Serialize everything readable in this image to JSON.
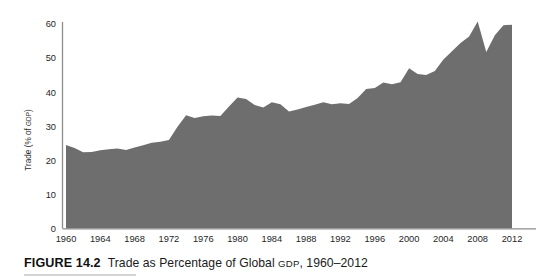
{
  "figure": {
    "label": "FIGURE 14.2",
    "title_before_gdp": "Trade as Percentage of Global ",
    "title_gdp": "GDP",
    "title_after_gdp": ", 1960–2012"
  },
  "axes": {
    "y_label_before_gdp": "Trade (% of ",
    "y_label_gdp": "GDP",
    "y_label_after_gdp": ")",
    "y_ticks": [
      "0",
      "10",
      "20",
      "30",
      "40",
      "50",
      "60"
    ],
    "x_ticks": [
      "1960",
      "1964",
      "1968",
      "1972",
      "1976",
      "1980",
      "1984",
      "1988",
      "1992",
      "1996",
      "2000",
      "2004",
      "2008",
      "2012"
    ]
  },
  "colors": {
    "area_fill": "#6e6e6e",
    "axis_line": "#8c8c8c",
    "text": "#1a1a1a",
    "background": "#ffffff"
  },
  "chart_data": {
    "type": "area",
    "title": "Trade as Percentage of Global GDP, 1960–2012",
    "xlabel": "",
    "ylabel": "Trade (% of GDP)",
    "ylim": [
      0,
      62
    ],
    "xlim": [
      1960,
      2012
    ],
    "grid": false,
    "legend": "none",
    "x": [
      1960,
      1961,
      1962,
      1963,
      1964,
      1965,
      1966,
      1967,
      1968,
      1969,
      1970,
      1971,
      1972,
      1973,
      1974,
      1975,
      1976,
      1977,
      1978,
      1979,
      1980,
      1981,
      1982,
      1983,
      1984,
      1985,
      1986,
      1987,
      1988,
      1989,
      1990,
      1991,
      1992,
      1993,
      1994,
      1995,
      1996,
      1997,
      1998,
      1999,
      2000,
      2001,
      2002,
      2003,
      2004,
      2005,
      2006,
      2007,
      2008,
      2009,
      2010,
      2011,
      2012
    ],
    "values": [
      24.5,
      23.6,
      22.3,
      22.4,
      22.9,
      23.2,
      23.4,
      23.0,
      23.7,
      24.4,
      25.1,
      25.4,
      25.9,
      29.8,
      33.2,
      32.4,
      32.9,
      33.1,
      33.0,
      35.8,
      38.4,
      38.0,
      36.2,
      35.5,
      37.0,
      36.4,
      34.3,
      34.9,
      35.6,
      36.3,
      37.0,
      36.4,
      36.7,
      36.5,
      38.3,
      40.9,
      41.2,
      42.8,
      42.3,
      42.9,
      47.0,
      45.3,
      45.0,
      46.2,
      49.6,
      52.0,
      54.4,
      56.3,
      60.7,
      51.8,
      56.7,
      59.6,
      59.8
    ]
  }
}
